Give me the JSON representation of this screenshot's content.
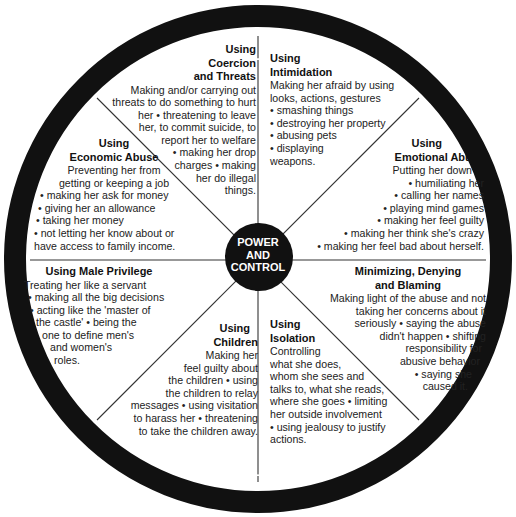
{
  "ring": {
    "top": {
      "left": "PHYSICAL",
      "middle": "VIOLENCE",
      "right": "SEXUAL"
    },
    "bottom": {
      "left": "PHYSICAL",
      "middle": "VIOLENCE",
      "right": "SEXUAL"
    },
    "color": "#111111"
  },
  "hub": {
    "line1": "POWER",
    "line2": "AND",
    "line3": "CONTROL"
  },
  "segments": {
    "coercion": {
      "title1": "Using",
      "title2": "Coercion",
      "title3": "and Threats",
      "lines": [
        "Making and/or carrying out",
        "threats to do something to hurt",
        "her • threatening to leave",
        "her, to commit suicide, to",
        "report her to welfare",
        "• making her drop",
        "charges • making",
        "her do illegal",
        "things."
      ]
    },
    "intimidation": {
      "title1": "Using",
      "title2": "Intimidation",
      "lines": [
        "Making her afraid by using",
        "looks, actions, gestures",
        "• smashing things",
        "• destroying her property",
        "• abusing pets",
        "• displaying",
        "weapons."
      ]
    },
    "economic": {
      "title1": "Using",
      "title2": "Economic Abuse",
      "lines": [
        "Preventing her from",
        "getting or keeping a job",
        "• making her ask for money",
        "• giving her an allowance",
        "• taking her money",
        "• not letting her know about or",
        "have access to family income."
      ]
    },
    "emotional": {
      "title1": "Using",
      "title2": "Emotional Abuse",
      "lines": [
        "Putting her down",
        "• humiliating her",
        "• calling her names",
        "• playing mind games",
        "• making her feel guilty",
        "• making her think she's crazy",
        "• making her feel bad about herself."
      ]
    },
    "male_privilege": {
      "title1": "Using Male Privilege",
      "lines": [
        "Treating her like a servant",
        "• making all the big decisions",
        "• acting like the 'master of",
        "the castle' • being the",
        "one to define men's",
        "and women's",
        "roles."
      ]
    },
    "minimizing": {
      "title1": "Minimizing, Denying",
      "title2": "and Blaming",
      "lines": [
        "Making light of the abuse and not",
        "taking her concerns about it",
        "seriously • saying the abuse",
        "didn't happen • shifting",
        "responsibility for",
        "abusive behavior",
        "• saying she",
        "caused it."
      ]
    },
    "children": {
      "title1": "Using",
      "title2": "Children",
      "lines": [
        "Making her",
        "feel guilty about",
        "the children • using",
        "the children to relay",
        "messages • using visitation",
        "to harass her • threatening",
        "to take the children away."
      ]
    },
    "isolation": {
      "title1": "Using",
      "title2": "Isolation",
      "lines": [
        "Controlling",
        "what she does,",
        "whom she sees and",
        "talks to, what she reads,",
        "where she goes • limiting",
        "her outside involvement",
        "• using jealousy to justify",
        "actions."
      ]
    }
  }
}
